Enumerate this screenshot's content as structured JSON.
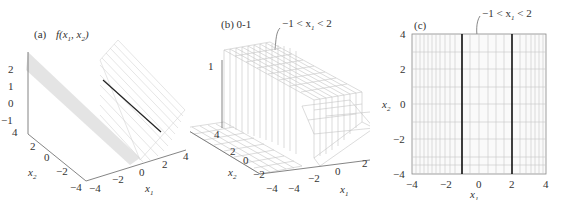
{
  "figure": {
    "panels": [
      {
        "id": "a",
        "label": "(a)",
        "title": "f(x1, x2)",
        "title_parts": {
          "f": "f(x",
          "sub1": "1",
          "mid": ", x",
          "sub2": "2",
          "end": ")"
        },
        "z_ticks": [
          "2",
          "1",
          "0",
          "−1"
        ],
        "x2_ticks": [
          "4",
          "2",
          "0",
          "−2",
          "−4"
        ],
        "x1_ticks": [
          "−4",
          "−2",
          "0",
          "2",
          "4"
        ],
        "x1_label": "x",
        "x1_sub": "1",
        "x2_label": "x",
        "x2_sub": "2"
      },
      {
        "id": "b",
        "label": "(b) 0-1",
        "annotation": "−1 < x1 < 2",
        "annotation_parts": {
          "pre": "−1 < x",
          "sub": "1",
          "post": " < 2"
        },
        "z_ticks": [
          "1"
        ],
        "x2_ticks": [
          "4",
          "2",
          "0",
          "−2",
          "−4"
        ],
        "x1_ticks": [
          "−4",
          "−2",
          "0",
          "2"
        ],
        "x1_label": "x",
        "x1_sub": "1",
        "x2_label": "x",
        "x2_sub": "2"
      },
      {
        "id": "c",
        "label": "(c)",
        "annotation": "−1 < x1 < 2",
        "annotation_parts": {
          "pre": "−1 < x",
          "sub": "1",
          "post": " < 2"
        },
        "y_ticks": [
          "4",
          "2",
          "0",
          "−2",
          "−4"
        ],
        "x_ticks": [
          "−4",
          "−2",
          "0",
          "2",
          "4"
        ],
        "x1_label": "x",
        "x1_sub": "1",
        "x2_label": "x",
        "x2_sub": "2",
        "boundary_lines": [
          -1,
          2
        ]
      }
    ]
  },
  "colors": {
    "axis": "#666666",
    "surface_line": "#cfcfcf",
    "grid": "#bdbdbd",
    "bold_line": "#111111"
  }
}
